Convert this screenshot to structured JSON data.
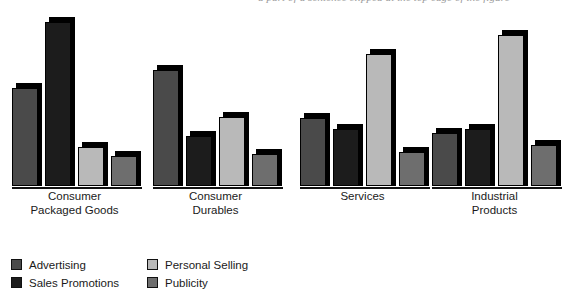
{
  "caption": {
    "text": "a part of a sentence clipped at the top edge of the figure"
  },
  "colors": {
    "advertising": "#4a4a4a",
    "sales_promotions": "#1c1c1c",
    "personal_selling": "#b9b9b9",
    "publicity": "#6e6e6e",
    "shadow": "#000000",
    "outline": "#000000",
    "background": "#ffffff",
    "text": "#1a1a1a"
  },
  "legend": {
    "position": "bottom-left",
    "columns": 2,
    "items": [
      {
        "label": "Advertising",
        "color": "#4a4a4a",
        "series": "advertising"
      },
      {
        "label": "Sales Promotions",
        "color": "#1c1c1c",
        "series": "sales_promotions"
      },
      {
        "label": "Personal Selling",
        "color": "#b9b9b9",
        "series": "personal_selling"
      },
      {
        "label": "Publicity",
        "color": "#6e6e6e",
        "series": "publicity"
      }
    ]
  },
  "chart_data": {
    "type": "bar",
    "title": "",
    "subtitle": "",
    "xlabel": "",
    "ylabel": "",
    "grid": false,
    "axis_visible": false,
    "ylim": [
      0,
      100
    ],
    "categories": [
      "Consumer\nPackaged Goods",
      "Consumer\nDurables",
      "Services",
      "Industrial\nProducts"
    ],
    "category_labels_flat": [
      "Consumer Packaged Goods",
      "Consumer Durables",
      "Services",
      "Industrial Products"
    ],
    "series": [
      {
        "name": "Advertising",
        "color": "#4a4a4a",
        "values": [
          55,
          65,
          38,
          30
        ]
      },
      {
        "name": "Sales Promotions",
        "color": "#1c1c1c",
        "values": [
          92,
          28,
          32,
          32
        ]
      },
      {
        "name": "Personal Selling",
        "color": "#b9b9b9",
        "values": [
          22,
          39,
          74,
          85
        ]
      },
      {
        "name": "Publicity",
        "color": "#6e6e6e",
        "values": [
          17,
          18,
          19,
          23
        ]
      }
    ],
    "groups": [
      {
        "category": "Consumer Packaged Goods",
        "bars": [
          {
            "series": "Advertising",
            "value": 55
          },
          {
            "series": "Sales Promotions",
            "value": 92
          },
          {
            "series": "Personal Selling",
            "value": 22
          },
          {
            "series": "Publicity",
            "value": 17
          }
        ]
      },
      {
        "category": "Consumer Durables",
        "bars": [
          {
            "series": "Advertising",
            "value": 65
          },
          {
            "series": "Sales Promotions",
            "value": 28
          },
          {
            "series": "Personal Selling",
            "value": 39
          },
          {
            "series": "Publicity",
            "value": 18
          }
        ]
      },
      {
        "category": "Services",
        "bars": [
          {
            "series": "Advertising",
            "value": 38
          },
          {
            "series": "Sales Promotions",
            "value": 32
          },
          {
            "series": "Personal Selling",
            "value": 74
          },
          {
            "series": "Publicity",
            "value": 19
          }
        ]
      },
      {
        "category": "Industrial Products",
        "bars": [
          {
            "series": "Advertising",
            "value": 30
          },
          {
            "series": "Sales Promotions",
            "value": 32
          },
          {
            "series": "Personal Selling",
            "value": 85
          },
          {
            "series": "Publicity",
            "value": 23
          }
        ]
      }
    ]
  },
  "layout": {
    "group_left_positions": [
      12,
      153,
      300,
      432
    ],
    "group_width": 125,
    "bar_width": 26,
    "bar_gap": 7,
    "plot_height_px": 178,
    "value_to_px": 1.78
  }
}
